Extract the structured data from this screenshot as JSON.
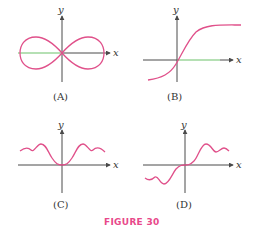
{
  "figure": {
    "caption": "FIGURE 30",
    "caption_color": "#e8488a",
    "curve_color": "#e0508a",
    "axis_color": "#4a4a4a"
  },
  "panels": [
    {
      "id": "A",
      "label": "(A)",
      "x_label": "x",
      "y_label": "y",
      "description": "Figure-eight (lemniscate) curve symmetric about both axes, crossing at the origin"
    },
    {
      "id": "B",
      "label": "(B)",
      "x_label": "x",
      "y_label": "y",
      "description": "Increasing S-shaped (sigmoid) curve passing through the origin with horizontal asymptotes"
    },
    {
      "id": "C",
      "label": "(C)",
      "x_label": "x",
      "y_label": "y",
      "description": "Even function: touches zero at origin, oscillating bumps on both sides above the x-axis"
    },
    {
      "id": "D",
      "label": "(D)",
      "x_label": "x",
      "y_label": "y",
      "description": "Odd function: passes through origin, oscillating bumps above for x>0 and below for x<0"
    }
  ]
}
